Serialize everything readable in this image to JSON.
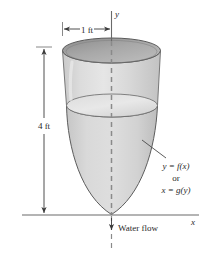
{
  "figure": {
    "axes": {
      "y_axis_label": "y",
      "x_axis_label": "x"
    },
    "dimensions": {
      "width_label": "1 ft",
      "height_label": "4 ft"
    },
    "curve_labels": {
      "line1": "y = f(x)",
      "connector": "or",
      "line2": "x = g(y)"
    },
    "flow": {
      "label": "Water flow"
    },
    "colors": {
      "vessel_fill": "#d2d2d2",
      "vessel_fill_light": "#e4e4e4",
      "rim_fill_dark": "#9a9a9a",
      "rim_fill_light": "#c4c4c4",
      "outline": "#555555",
      "axis": "#6a6a6a",
      "dashed_axis": "#808080",
      "text": "#2a2a2a",
      "background": "#ffffff"
    }
  }
}
